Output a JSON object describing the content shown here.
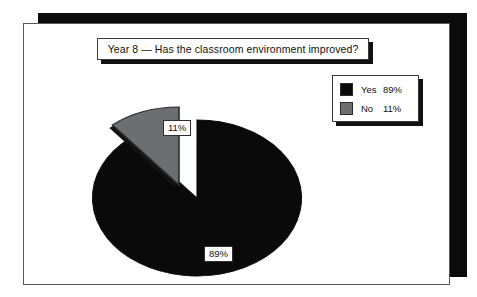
{
  "chart_data": {
    "type": "pie",
    "title": "Year 8 — Has the classroom environment improved?",
    "categories": [
      "Yes",
      "No"
    ],
    "values": [
      89,
      11
    ],
    "value_labels": [
      "89%",
      "11%"
    ],
    "units": "percent",
    "exploded_slices": [
      "No"
    ],
    "legend_position": "top-right",
    "grid": false,
    "colors": {
      "Yes": "#0a0a0a",
      "No": "#6b6f72"
    },
    "slices": [
      {
        "name": "Yes",
        "value": 89,
        "label": "89%",
        "color": "#0a0a0a",
        "exploded": false
      },
      {
        "name": "No",
        "value": 11,
        "label": "11%",
        "color": "#6b6f72",
        "exploded": true
      }
    ]
  },
  "panel": {
    "title_text": "Year 8 — Has the classroom environment improved?"
  },
  "legend": {
    "rows": [
      {
        "label": "Yes",
        "value": "89%",
        "color": "#0a0a0a"
      },
      {
        "label": "No",
        "value": "11%",
        "color": "#6b6f72"
      }
    ]
  },
  "labels": {
    "yes_slice": "89%",
    "no_slice": "11%"
  },
  "theme": {
    "panel_background": "#ffffff",
    "panel_border": "#555a5e",
    "shadow_color": "#0b0b0b",
    "text_color": "#121212"
  }
}
